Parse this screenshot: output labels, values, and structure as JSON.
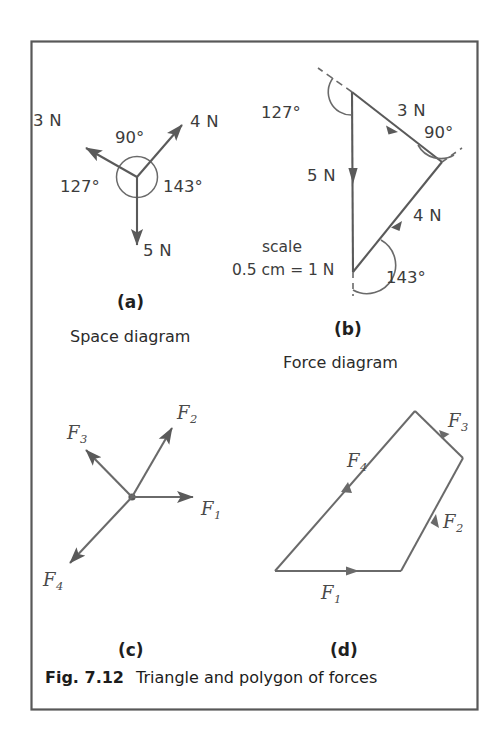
{
  "figure": {
    "number_label": "Fig. 7.12",
    "caption_text": "Triangle and polygon of forces",
    "border_color": "#585858",
    "ink_color": "#5a5a5a",
    "text_color": "#3c3c3c"
  },
  "panels": [
    {
      "id": "a",
      "tag": "(a)",
      "title": "Space diagram",
      "forces": [
        {
          "name": "3 N",
          "magnitude": 3,
          "unit": "N"
        },
        {
          "name": "4 N",
          "magnitude": 4,
          "unit": "N"
        },
        {
          "name": "5 N",
          "magnitude": 5,
          "unit": "N"
        }
      ],
      "angles": [
        {
          "value": "90°",
          "degrees": 90,
          "between": "3 N and 4 N"
        },
        {
          "value": "127°",
          "degrees": 127,
          "between": "3 N and 5 N"
        },
        {
          "value": "143°",
          "degrees": 143,
          "between": "4 N and 5 N"
        }
      ]
    },
    {
      "id": "b",
      "tag": "(b)",
      "title": "Force diagram",
      "scale_line1": "scale",
      "scale_line2": "0.5 cm = 1 N",
      "forces": [
        {
          "name": "3 N",
          "magnitude": 3,
          "unit": "N"
        },
        {
          "name": "4 N",
          "magnitude": 4,
          "unit": "N"
        },
        {
          "name": "5 N",
          "magnitude": 5,
          "unit": "N"
        }
      ],
      "angles": [
        {
          "value": "127°",
          "degrees": 127
        },
        {
          "value": "90°",
          "degrees": 90
        },
        {
          "value": "143°",
          "degrees": 143
        }
      ]
    },
    {
      "id": "c",
      "tag": "(c)",
      "title": "",
      "forces": [
        {
          "symbol": "F",
          "index": "1"
        },
        {
          "symbol": "F",
          "index": "2"
        },
        {
          "symbol": "F",
          "index": "3"
        },
        {
          "symbol": "F",
          "index": "4"
        }
      ]
    },
    {
      "id": "d",
      "tag": "(d)",
      "title": "",
      "forces": [
        {
          "symbol": "F",
          "index": "1"
        },
        {
          "symbol": "F",
          "index": "2"
        },
        {
          "symbol": "F",
          "index": "3"
        },
        {
          "symbol": "F",
          "index": "4"
        }
      ]
    }
  ],
  "labels": {
    "a_f3": "3 N",
    "a_f4": "4 N",
    "a_f5": "5 N",
    "a_ang90": "90°",
    "a_ang127": "127°",
    "a_ang143": "143°",
    "a_tag": "(a)",
    "a_title": "Space diagram",
    "b_f3": "3 N",
    "b_f4": "4 N",
    "b_f5": "5 N",
    "b_ang90": "90°",
    "b_ang127": "127°",
    "b_ang143": "143°",
    "b_scale1": "scale",
    "b_scale2": "0.5 cm = 1 N",
    "b_tag": "(b)",
    "b_title": "Force diagram",
    "c_tag": "(c)",
    "d_tag": "(d)",
    "fig_num": "Fig. 7.12",
    "fig_text": "Triangle and polygon of forces"
  }
}
